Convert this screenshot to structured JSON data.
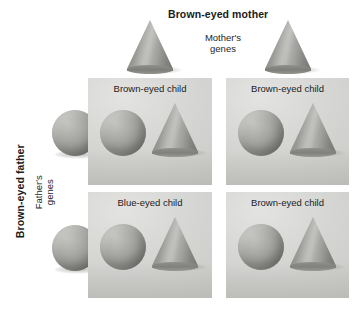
{
  "figure": {
    "mother_title": "Brown-eyed mother",
    "mother_genes_label": "Mother's\ngenes",
    "father_title": "Brown-eyed father",
    "father_genes_label": "Father's\ngenes"
  },
  "colors": {
    "panel_background": "#d6d6d4",
    "page_background": "#ffffff",
    "shape_gray": "#9a9a97",
    "text": "#1b1b1b"
  },
  "parent_genes": {
    "mother": [
      {
        "shape": "cone",
        "name": "mother-gene-cone-1"
      },
      {
        "shape": "cone",
        "name": "mother-gene-cone-2"
      }
    ],
    "father": [
      {
        "shape": "sphere",
        "name": "father-gene-sphere-1"
      },
      {
        "shape": "sphere",
        "name": "father-gene-sphere-2"
      }
    ]
  },
  "offspring": [
    {
      "id": "top-left",
      "label": "Brown-eyed child",
      "shapes": [
        "sphere",
        "cone"
      ]
    },
    {
      "id": "top-right",
      "label": "Brown-eyed child",
      "shapes": [
        "sphere",
        "cone"
      ]
    },
    {
      "id": "bottom-left",
      "label": "Blue-eyed child",
      "shapes": [
        "sphere",
        "cone"
      ]
    },
    {
      "id": "bottom-right",
      "label": "Brown-eyed child",
      "shapes": [
        "sphere",
        "cone"
      ]
    }
  ]
}
